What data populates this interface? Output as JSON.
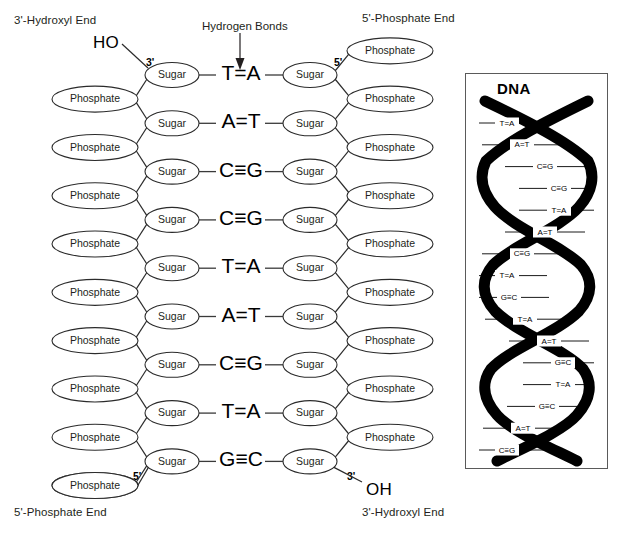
{
  "labels": {
    "top_left_end": "3'-Hydroxyl End",
    "top_right_end": "5'-Phosphate End",
    "bottom_left_end": "5'-Phosphate End",
    "bottom_right_end": "3'-Hydroxyl End",
    "hydrogen_bonds": "Hydrogen Bonds",
    "hydroxyl_top": "HO",
    "hydroxyl_bottom": "OH",
    "prime_top_left": "3'",
    "prime_top_right": "5'",
    "prime_bottom_left": "5'",
    "prime_bottom_right": "3'"
  },
  "node_names": {
    "sugar": "Sugar",
    "phosphate": "Phosphate"
  },
  "chart_data": {
    "type": "diagram",
    "base_pairs": [
      {
        "left": "T",
        "bond": "=",
        "right": "A",
        "bond_count": 2,
        "text": "T=A"
      },
      {
        "left": "A",
        "bond": "=",
        "right": "T",
        "bond_count": 2,
        "text": "A=T"
      },
      {
        "left": "C",
        "bond": "≡",
        "right": "G",
        "bond_count": 3,
        "text": "C≡G"
      },
      {
        "left": "C",
        "bond": "≡",
        "right": "G",
        "bond_count": 3,
        "text": "C≡G"
      },
      {
        "left": "T",
        "bond": "=",
        "right": "A",
        "bond_count": 2,
        "text": "T=A"
      },
      {
        "left": "A",
        "bond": "=",
        "right": "T",
        "bond_count": 2,
        "text": "A=T"
      },
      {
        "left": "C",
        "bond": "≡",
        "right": "G",
        "bond_count": 3,
        "text": "C≡G"
      },
      {
        "left": "T",
        "bond": "=",
        "right": "A",
        "bond_count": 2,
        "text": "T=A"
      },
      {
        "left": "G",
        "bond": "≡",
        "right": "C",
        "bond_count": 3,
        "text": "G≡C"
      }
    ],
    "left_strand_5to3": "G T C A T C C A T",
    "right_strand": "C A G T A G G T A",
    "sugar_count_per_strand": 9,
    "left_phosphate_count": 10,
    "right_phosphate_count": 9
  },
  "inset": {
    "title": "DNA",
    "base_pairs": [
      "T=A",
      "A=T",
      "C≡G",
      "C≡G",
      "T=A",
      "A=T",
      "C≡G",
      "T=A",
      "G≡C",
      "T=A",
      "A=T",
      "G≡C",
      "T=A",
      "G≡C",
      "A=T",
      "C≡G"
    ]
  },
  "colors": {
    "ink": "#231f20",
    "stroke": "#2b2b2b",
    "helix": "#000000",
    "box_border": "#5a5a5a",
    "background": "#ffffff"
  }
}
